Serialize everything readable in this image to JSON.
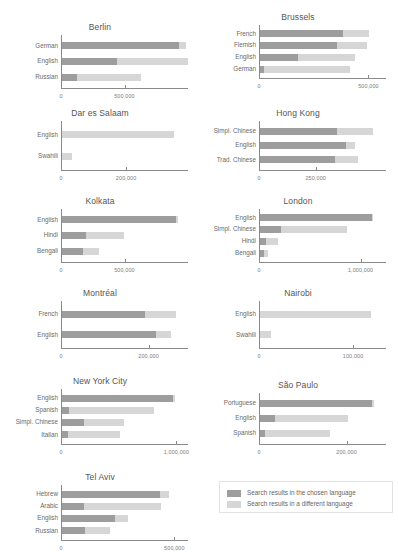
{
  "legend": {
    "items": [
      {
        "label": "Search results in the chosen language",
        "color": "#9d9d9d",
        "key": "chosen"
      },
      {
        "label": "Search results in a different language",
        "color": "#d6d6d6",
        "key": "different"
      }
    ]
  },
  "colors": {
    "chosen": "#9d9d9d",
    "different": "#d6d6d6",
    "axis": "#8a8a8a",
    "text": "#555555",
    "background": "#ffffff"
  },
  "chart_data": {
    "type": "bar",
    "orientation": "horizontal",
    "stacked": true,
    "grid": false,
    "legend_position": "bottom-right",
    "series": [
      {
        "name": "Search results in the chosen language",
        "key": "chosen",
        "color": "#9d9d9d"
      },
      {
        "name": "Search results in a different language",
        "key": "different",
        "color": "#d6d6d6"
      }
    ],
    "panels": [
      {
        "title": "Berlin",
        "xlabel": "",
        "ylabel": "",
        "xlim": [
          0,
          1000000
        ],
        "xticks": [
          0,
          500000
        ],
        "xticklabels": [
          "0",
          "500,000"
        ],
        "categories": [
          "German",
          "English",
          "Russian"
        ],
        "values": {
          "chosen": [
            920000,
            430000,
            120000
          ],
          "different": [
            60000,
            560000,
            500000
          ]
        },
        "totals": [
          980000,
          990000,
          620000
        ]
      },
      {
        "title": "Brussels",
        "xlabel": "",
        "ylabel": "",
        "xlim": [
          0,
          580000
        ],
        "xticks": [
          0,
          500000
        ],
        "xticklabels": [
          "0",
          "500,000"
        ],
        "categories": [
          "French",
          "Flemish",
          "English",
          "German"
        ],
        "values": {
          "chosen": [
            380000,
            350000,
            175000,
            20000
          ],
          "different": [
            120000,
            140000,
            260000,
            390000
          ]
        },
        "totals": [
          500000,
          490000,
          435000,
          410000
        ]
      },
      {
        "title": "Dar es Salaam",
        "xlabel": "",
        "ylabel": "",
        "xlim": [
          0,
          390000
        ],
        "xticks": [
          0,
          200000
        ],
        "xticklabels": [
          "0",
          "200,000"
        ],
        "categories": [
          "English",
          "Swahili"
        ],
        "values": {
          "chosen": [
            0,
            0
          ],
          "different": [
            345000,
            32000
          ]
        },
        "totals": [
          345000,
          32000
        ]
      },
      {
        "title": "Hong Kong",
        "xlabel": "",
        "ylabel": "",
        "xlim": [
          0,
          560000
        ],
        "xticks": [
          0,
          250000
        ],
        "xticklabels": [
          "0",
          "250,000"
        ],
        "categories": [
          "Simpl. Chinese",
          "English",
          "Trad. Chinese"
        ],
        "values": {
          "chosen": [
            340000,
            380000,
            330000
          ],
          "different": [
            160000,
            40000,
            100000
          ]
        },
        "totals": [
          500000,
          420000,
          430000
        ]
      },
      {
        "title": "Kolkata",
        "xlabel": "",
        "ylabel": "",
        "xlim": [
          0,
          1000000
        ],
        "xticks": [
          0,
          500000
        ],
        "xticklabels": [
          "0",
          "500,000"
        ],
        "categories": [
          "English",
          "Hindi",
          "Bengali"
        ],
        "values": {
          "chosen": [
            900000,
            190000,
            165000
          ],
          "different": [
            10000,
            300000,
            130000
          ]
        },
        "totals": [
          910000,
          490000,
          295000
        ]
      },
      {
        "title": "London",
        "xlabel": "",
        "ylabel": "",
        "xlim": [
          0,
          1250000
        ],
        "xticks": [
          0,
          1000000
        ],
        "xticklabels": [
          "0",
          "1,000,000"
        ],
        "categories": [
          "English",
          "Simpl. Chinese",
          "Hindi",
          "Bengali"
        ],
        "values": {
          "chosen": [
            1100000,
            210000,
            55000,
            40000
          ],
          "different": [
            10000,
            650000,
            125000,
            35000
          ]
        },
        "totals": [
          1110000,
          860000,
          180000,
          75000
        ]
      },
      {
        "title": "Montréal",
        "xlabel": "",
        "ylabel": "",
        "xlim": [
          0,
          290000
        ],
        "xticks": [
          0,
          200000
        ],
        "xticklabels": [
          "0",
          "200,000"
        ],
        "categories": [
          "French",
          "English"
        ],
        "values": {
          "chosen": [
            190000,
            215000
          ],
          "different": [
            70000,
            35000
          ]
        },
        "totals": [
          260000,
          250000
        ]
      },
      {
        "title": "Nairobi",
        "xlabel": "",
        "ylabel": "",
        "xlim": [
          0,
          135000
        ],
        "xticks": [
          0,
          100000
        ],
        "xticklabels": [
          "0",
          "100,000"
        ],
        "categories": [
          "English",
          "Swahili"
        ],
        "values": {
          "chosen": [
            0,
            0
          ],
          "different": [
            118000,
            12000
          ]
        },
        "totals": [
          118000,
          12000
        ]
      },
      {
        "title": "New York City",
        "xlabel": "",
        "ylabel": "",
        "xlim": [
          0,
          1100000
        ],
        "xticks": [
          0,
          1000000
        ],
        "xticklabels": [
          "0",
          "1,000,000"
        ],
        "categories": [
          "English",
          "Spanish",
          "Simpl. Chinese",
          "Italian"
        ],
        "values": {
          "chosen": [
            960000,
            60000,
            190000,
            50000
          ],
          "different": [
            20000,
            740000,
            350000,
            450000
          ]
        },
        "totals": [
          980000,
          800000,
          540000,
          500000
        ]
      },
      {
        "title": "São Paulo",
        "xlabel": "",
        "ylabel": "",
        "xlim": [
          0,
          290000
        ],
        "xticks": [
          0,
          200000
        ],
        "xticklabels": [
          "0",
          "200,000"
        ],
        "categories": [
          "Portuguese",
          "English",
          "Spanish"
        ],
        "values": {
          "chosen": [
            255000,
            35000,
            12000
          ],
          "different": [
            5000,
            165000,
            148000
          ]
        },
        "totals": [
          260000,
          200000,
          160000
        ]
      },
      {
        "title": "Tel Aviv",
        "xlabel": "",
        "ylabel": "",
        "xlim": [
          0,
          560000
        ],
        "xticks": [
          0,
          500000
        ],
        "xticklabels": [
          "0",
          "500,000"
        ],
        "categories": [
          "Hebrew",
          "Arabic",
          "English",
          "Russian"
        ],
        "values": {
          "chosen": [
            430000,
            95000,
            235000,
            100000
          ],
          "different": [
            40000,
            340000,
            55000,
            110000
          ]
        },
        "totals": [
          470000,
          435000,
          290000,
          210000
        ]
      }
    ]
  },
  "layout": {
    "panel_boxes": [
      {
        "left": 4,
        "top": 22,
        "width": 192,
        "height": 82
      },
      {
        "left": 202,
        "top": 12,
        "width": 192,
        "height": 82
      },
      {
        "left": 4,
        "top": 108,
        "width": 192,
        "height": 78
      },
      {
        "left": 202,
        "top": 108,
        "width": 192,
        "height": 78
      },
      {
        "left": 4,
        "top": 196,
        "width": 192,
        "height": 82
      },
      {
        "left": 202,
        "top": 196,
        "width": 192,
        "height": 82
      },
      {
        "left": 4,
        "top": 288,
        "width": 192,
        "height": 76
      },
      {
        "left": 202,
        "top": 288,
        "width": 192,
        "height": 76
      },
      {
        "left": 4,
        "top": 376,
        "width": 192,
        "height": 84
      },
      {
        "left": 202,
        "top": 380,
        "width": 192,
        "height": 80
      },
      {
        "left": 4,
        "top": 472,
        "width": 192,
        "height": 84
      }
    ],
    "plot_left": 57,
    "plot_right_pad": 8,
    "bar_height": 7
  }
}
